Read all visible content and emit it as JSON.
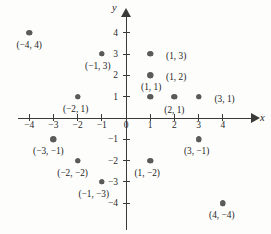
{
  "chart_data": {
    "type": "scatter",
    "title": "",
    "xlabel": "x",
    "ylabel": "y",
    "xlim": [
      -4.8,
      5.2
    ],
    "ylim": [
      -4.8,
      4.8
    ],
    "grid": false,
    "legend": null,
    "x_ticks": [
      -4,
      -3,
      -2,
      -1,
      0,
      1,
      2,
      3,
      4
    ],
    "y_ticks": [
      4,
      3,
      2,
      1,
      -1,
      -2,
      -3,
      -4
    ],
    "origin_label": "0",
    "points": [
      {
        "x": -4,
        "y": 4,
        "label": "(−4, 4)",
        "label_dx": 0,
        "label_dy": 13
      },
      {
        "x": -1,
        "y": 3,
        "label": "(−1, 3)",
        "label_dx": -4,
        "label_dy": 13
      },
      {
        "x": -2,
        "y": 1,
        "label": "(−2, 1)",
        "label_dx": -2,
        "label_dy": 13
      },
      {
        "x": 1,
        "y": 3,
        "label": "(1, 3)",
        "label_dx": 26,
        "label_dy": 3
      },
      {
        "x": 1,
        "y": 2,
        "label": "(1, 2)",
        "label_dx": 26,
        "label_dy": 3
      },
      {
        "x": 1,
        "y": 1,
        "label": "(1, 1)",
        "label_dx": 1,
        "label_dy": -9
      },
      {
        "x": 2,
        "y": 1,
        "label": "(2, 1)",
        "label_dx": 0,
        "label_dy": 14
      },
      {
        "x": 3,
        "y": 1,
        "label": "(3, 1)",
        "label_dx": 26,
        "label_dy": 3
      },
      {
        "x": -3,
        "y": -1,
        "label": "(−3, −1)",
        "label_dx": -5,
        "label_dy": 13
      },
      {
        "x": -2,
        "y": -2,
        "label": "(−2, −2)",
        "label_dx": -5,
        "label_dy": 13
      },
      {
        "x": -1,
        "y": -3,
        "label": "(−1, −3)",
        "label_dx": -8,
        "label_dy": 13
      },
      {
        "x": 3,
        "y": -1,
        "label": "(3, −1)",
        "label_dx": -2,
        "label_dy": 13
      },
      {
        "x": 1,
        "y": -2,
        "label": "(1, −2)",
        "label_dx": -3,
        "label_dy": 13
      },
      {
        "x": 4,
        "y": -4,
        "label": "(4, −4)",
        "label_dx": -1,
        "label_dy": 13
      }
    ]
  }
}
